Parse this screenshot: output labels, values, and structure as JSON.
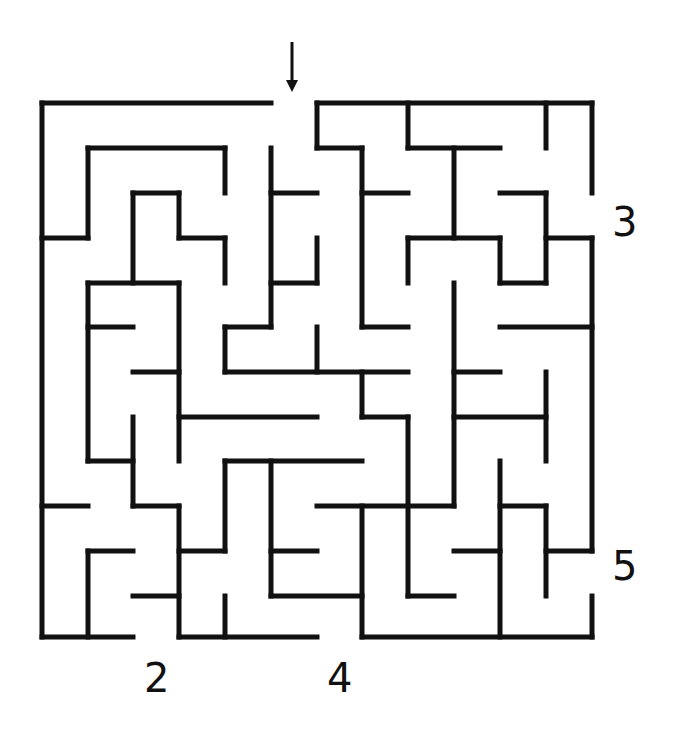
{
  "puzzle": {
    "type": "maze",
    "entrance_arrow": {
      "x": 292,
      "y1": 42,
      "y2": 92
    },
    "exit_labels": [
      {
        "text": "3",
        "x": 612,
        "y": 202
      },
      {
        "text": "5",
        "x": 612,
        "y": 546
      },
      {
        "text": "2",
        "x": 144,
        "y": 658
      },
      {
        "text": "4",
        "x": 327,
        "y": 658
      }
    ],
    "wall_color": "#111111",
    "wall_width": 5,
    "walls": [
      [
        42,
        103,
        271,
        103
      ],
      [
        317,
        103,
        592,
        103
      ],
      [
        42,
        103,
        42,
        637
      ],
      [
        592,
        103,
        592,
        193
      ],
      [
        317,
        103,
        317,
        148
      ],
      [
        317,
        148,
        362,
        148
      ],
      [
        408,
        103,
        408,
        148
      ],
      [
        408,
        148,
        500,
        148
      ],
      [
        454,
        148,
        454,
        238
      ],
      [
        546,
        103,
        546,
        148
      ],
      [
        88,
        148,
        225,
        148
      ],
      [
        88,
        148,
        88,
        238
      ],
      [
        42,
        238,
        88,
        238
      ],
      [
        225,
        148,
        225,
        193
      ],
      [
        271,
        148,
        271,
        327
      ],
      [
        271,
        193,
        317,
        193
      ],
      [
        317,
        238,
        317,
        283
      ],
      [
        271,
        283,
        317,
        283
      ],
      [
        362,
        148,
        362,
        327
      ],
      [
        362,
        193,
        408,
        193
      ],
      [
        362,
        327,
        408,
        327
      ],
      [
        133,
        193,
        179,
        193
      ],
      [
        133,
        193,
        133,
        283
      ],
      [
        179,
        193,
        179,
        238
      ],
      [
        179,
        238,
        225,
        238
      ],
      [
        225,
        238,
        225,
        283
      ],
      [
        408,
        238,
        408,
        283
      ],
      [
        408,
        238,
        500,
        238
      ],
      [
        500,
        238,
        500,
        283
      ],
      [
        500,
        283,
        546,
        283
      ],
      [
        546,
        193,
        546,
        283
      ],
      [
        500,
        193,
        546,
        193
      ],
      [
        546,
        238,
        592,
        238
      ],
      [
        592,
        238,
        592,
        551
      ],
      [
        88,
        283,
        179,
        283
      ],
      [
        88,
        283,
        88,
        461
      ],
      [
        88,
        327,
        133,
        327
      ],
      [
        179,
        283,
        179,
        461
      ],
      [
        225,
        327,
        271,
        327
      ],
      [
        225,
        327,
        225,
        372
      ],
      [
        225,
        372,
        408,
        372
      ],
      [
        317,
        327,
        317,
        372
      ],
      [
        454,
        283,
        454,
        506
      ],
      [
        500,
        327,
        592,
        327
      ],
      [
        133,
        372,
        179,
        372
      ],
      [
        362,
        372,
        362,
        417
      ],
      [
        362,
        417,
        408,
        417
      ],
      [
        408,
        417,
        408,
        596
      ],
      [
        408,
        596,
        454,
        596
      ],
      [
        454,
        372,
        500,
        372
      ],
      [
        454,
        417,
        546,
        417
      ],
      [
        546,
        372,
        546,
        461
      ],
      [
        179,
        417,
        317,
        417
      ],
      [
        133,
        417,
        133,
        506
      ],
      [
        88,
        461,
        133,
        461
      ],
      [
        133,
        506,
        179,
        506
      ],
      [
        179,
        506,
        179,
        637
      ],
      [
        225,
        461,
        362,
        461
      ],
      [
        225,
        461,
        225,
        551
      ],
      [
        179,
        551,
        225,
        551
      ],
      [
        271,
        461,
        271,
        596
      ],
      [
        271,
        551,
        317,
        551
      ],
      [
        271,
        596,
        362,
        596
      ],
      [
        317,
        506,
        454,
        506
      ],
      [
        362,
        506,
        362,
        637
      ],
      [
        362,
        637,
        592,
        637
      ],
      [
        592,
        596,
        592,
        637
      ],
      [
        500,
        461,
        500,
        637
      ],
      [
        500,
        506,
        546,
        506
      ],
      [
        546,
        506,
        546,
        596
      ],
      [
        546,
        551,
        592,
        551
      ],
      [
        454,
        551,
        500,
        551
      ],
      [
        42,
        506,
        88,
        506
      ],
      [
        88,
        551,
        133,
        551
      ],
      [
        88,
        551,
        88,
        637
      ],
      [
        42,
        637,
        133,
        637
      ],
      [
        133,
        596,
        179,
        596
      ],
      [
        179,
        637,
        317,
        637
      ],
      [
        225,
        596,
        225,
        637
      ]
    ]
  }
}
